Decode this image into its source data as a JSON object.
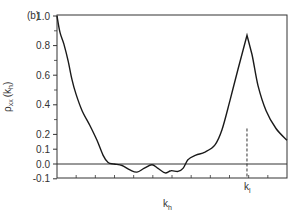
{
  "chart_data": {
    "type": "line",
    "title": "",
    "panel_label": "(b)",
    "xlabel": "k_h",
    "ylabel": "ρxx(kh)",
    "ylim": [
      -0.1,
      1.0
    ],
    "xlim": [
      0,
      1
    ],
    "grid": false,
    "legend": null,
    "y_ticks": [
      -0.1,
      0.0,
      0.1,
      0.2,
      0.4,
      0.6,
      0.8,
      1.0
    ],
    "y_tick_labels": [
      "-0.1",
      "0.0",
      "0.1",
      "0.2",
      "0.4",
      "0.6",
      "0.8",
      "1.0"
    ],
    "x_tick_count": 12,
    "x_tick_labels": [],
    "zero_line": true,
    "annotations": [
      {
        "type": "vline-dashed",
        "label": "k_l",
        "x": 0.826,
        "y_from": -0.1,
        "y_to": 0.24
      }
    ],
    "series": [
      {
        "name": "rho_xx(k_h)",
        "x": [
          0.0,
          0.013,
          0.03,
          0.048,
          0.065,
          0.083,
          0.109,
          0.143,
          0.174,
          0.2,
          0.222,
          0.248,
          0.283,
          0.317,
          0.348,
          0.378,
          0.413,
          0.439,
          0.47,
          0.496,
          0.526,
          0.548,
          0.57,
          0.604,
          0.643,
          0.687,
          0.717,
          0.752,
          0.787,
          0.809,
          0.826,
          0.848,
          0.874,
          0.909,
          0.952,
          1.0
        ],
        "values": [
          1.0,
          0.89,
          0.81,
          0.7,
          0.57,
          0.47,
          0.36,
          0.26,
          0.16,
          0.06,
          0.01,
          0.0,
          -0.01,
          -0.04,
          -0.055,
          -0.03,
          -0.005,
          -0.03,
          -0.06,
          -0.045,
          -0.05,
          -0.03,
          0.03,
          0.06,
          0.08,
          0.13,
          0.23,
          0.43,
          0.64,
          0.77,
          0.87,
          0.74,
          0.53,
          0.36,
          0.24,
          0.16
        ]
      }
    ]
  },
  "labels": {
    "panel": "(b)",
    "x_axis": "k",
    "x_axis_sub": "h",
    "y_axis_main": "ρ",
    "y_axis_sub": "xx",
    "y_axis_arg": "(k",
    "y_axis_arg_sub": "h",
    "y_axis_close": ")",
    "kl_main": "k",
    "kl_sub": "l"
  },
  "colors": {
    "line": "#1a1a1a",
    "axis": "#333333",
    "background": "#ffffff"
  }
}
